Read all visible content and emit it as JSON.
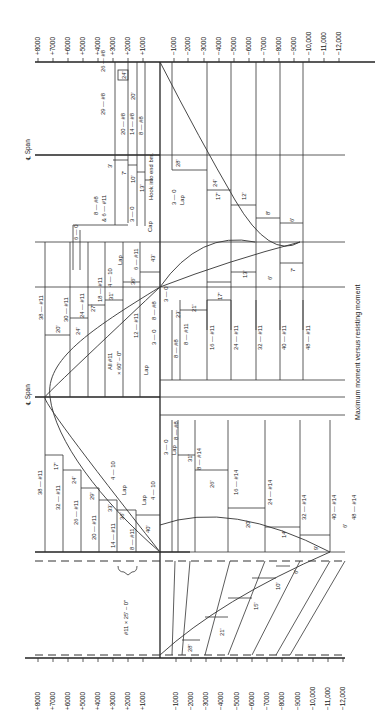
{
  "caption": "Maximum moment versus resisting moment",
  "centerline_label": "℄ Span",
  "axis": {
    "positive_ticks": [
      "+8000",
      "+7000",
      "+6000",
      "+5000",
      "+4000",
      "+3000",
      "+2000",
      "+1000"
    ],
    "negative_ticks": [
      "−1000",
      "−2000",
      "−3000",
      "−4000",
      "−5000",
      "−6000",
      "−7000",
      "−8000",
      "−9000",
      "−10,000",
      "−11,000",
      "−12,000"
    ]
  },
  "top_span": {
    "positive_bars": [
      "29 — #8",
      "26 — #8",
      "20 — #8",
      "14 — #8",
      "8 — #8"
    ],
    "lengths": [
      "24'",
      "20'",
      "3'",
      "7'",
      "10'",
      "13'"
    ],
    "notes": [
      "Hook into end bm.",
      "8 — #8",
      "& 6 — #11",
      "3 — 0",
      "Cap",
      "6 — 0",
      "Lap"
    ],
    "negative_lengths": [
      "28'",
      "24'",
      "17'",
      "12'",
      "8'",
      "6'"
    ],
    "negative_bottom_lengths": [
      "13'",
      "6'",
      "7'"
    ]
  },
  "middle_span": {
    "positive_bars": [
      "38 — #11",
      "30 — #11",
      "24 — #11",
      "18 — #11",
      "12 — #11",
      "6 — #11"
    ],
    "lengths": [
      "20'",
      "24'",
      "27'",
      "31'",
      "36'",
      "43'"
    ],
    "notes": [
      "All #11",
      "× 60' – 0\"",
      "4 — 10",
      "Lap",
      "Lap",
      "3 — 0",
      "8 — #8",
      "3 — 0"
    ],
    "negative_bars": [
      "8 — #8",
      "8 — #11",
      "16 — #11",
      "24 — #11",
      "32 — #11",
      "40 — #11",
      "48 — #11"
    ],
    "negative_lengths": [
      "23'",
      "21'",
      "17'"
    ]
  },
  "bottom_span": {
    "positive_bars": [
      "38 — #11",
      "32 — #11",
      "26 — #11",
      "20 — #11",
      "14 — #11",
      "8 — #11"
    ],
    "lengths": [
      "17'",
      "24'",
      "29'",
      "33'",
      "36'",
      "40'"
    ],
    "notes": [
      "4 — 10",
      "Lap",
      "4 — 10",
      "Lap",
      "3 — 0",
      "Lap",
      "#11 × 25' – 0\""
    ],
    "negative_bars": [
      "8 — #8",
      "8 — #14",
      "16 — #14",
      "24 — #14",
      "32 — #14",
      "40 — #14",
      "48 — #14"
    ],
    "negative_lengths": [
      "31'",
      "26'",
      "20'",
      "14'",
      "9'",
      "6'"
    ],
    "support_lengths": [
      "28'",
      "21'",
      "15'",
      "10'",
      "6'"
    ]
  }
}
